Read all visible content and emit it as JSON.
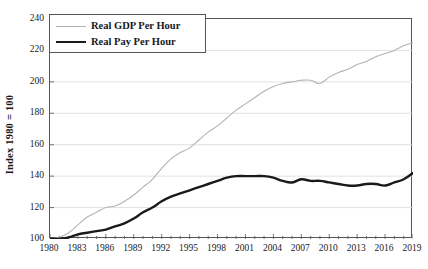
{
  "chart_data": {
    "type": "line",
    "title": "",
    "xlabel": "",
    "ylabel": "Index 1980 = 100",
    "xlim": [
      1980,
      2019
    ],
    "ylim": [
      100,
      240
    ],
    "grid": true,
    "grid_axis": "y",
    "legend_position": "upper-left",
    "y_ticks": [
      100,
      120,
      140,
      160,
      180,
      200,
      220,
      240
    ],
    "x_ticks_labeled": [
      1980,
      1983,
      1986,
      1989,
      1992,
      1995,
      1998,
      2001,
      2004,
      2007,
      2010,
      2013,
      2016,
      2019
    ],
    "x_ticks_minor_step": 1,
    "x": [
      1980,
      1981,
      1982,
      1983,
      1984,
      1985,
      1986,
      1987,
      1988,
      1989,
      1990,
      1991,
      1992,
      1993,
      1994,
      1995,
      1996,
      1997,
      1998,
      1999,
      2000,
      2001,
      2002,
      2003,
      2004,
      2005,
      2006,
      2007,
      2008,
      2009,
      2010,
      2011,
      2012,
      2013,
      2014,
      2015,
      2016,
      2017,
      2018,
      2019
    ],
    "series": [
      {
        "name": "Real GDP Per Hour",
        "color": "#b3b3b3",
        "width": 1.1,
        "values": [
          100,
          101,
          104,
          109,
          114,
          117,
          120,
          121,
          124,
          128,
          133,
          138,
          145,
          151,
          155,
          158,
          163,
          168,
          172,
          177,
          182,
          186,
          190,
          194,
          197,
          199,
          200,
          201,
          201,
          199,
          203,
          206,
          208,
          211,
          213,
          216,
          218,
          220,
          223,
          225
        ]
      },
      {
        "name": "Real Pay Per Hour",
        "color": "#1a1a1a",
        "width": 2.4,
        "values": [
          100,
          100,
          101,
          103,
          104,
          105,
          106,
          108,
          110,
          113,
          117,
          120,
          124,
          127,
          129,
          131,
          133,
          135,
          137,
          139,
          140,
          140,
          140,
          140,
          139,
          137,
          136,
          138,
          137,
          137,
          136,
          135,
          134,
          134,
          135,
          135,
          134,
          136,
          138,
          142
        ]
      }
    ]
  },
  "axes": {
    "y_title": "Index 1980 = 100",
    "y_tick_labels": [
      "240",
      "220",
      "200",
      "180",
      "160",
      "140",
      "120",
      "100"
    ],
    "x_tick_labels": [
      "1980",
      "1983",
      "1986",
      "1989",
      "1992",
      "1995",
      "1998",
      "2001",
      "2004",
      "2007",
      "2010",
      "2013",
      "2016",
      "2019"
    ]
  },
  "legend": {
    "entries": [
      {
        "label": "Real GDP Per Hour",
        "swatch": "thin-gray-line"
      },
      {
        "label": "Real Pay Per Hour",
        "swatch": "thick-black-line"
      }
    ]
  },
  "colors": {
    "gdp_line": "#b3b3b3",
    "pay_line": "#1a1a1a",
    "grid": "#d9d9d9",
    "frame": "#555555",
    "background": "#ffffff"
  }
}
